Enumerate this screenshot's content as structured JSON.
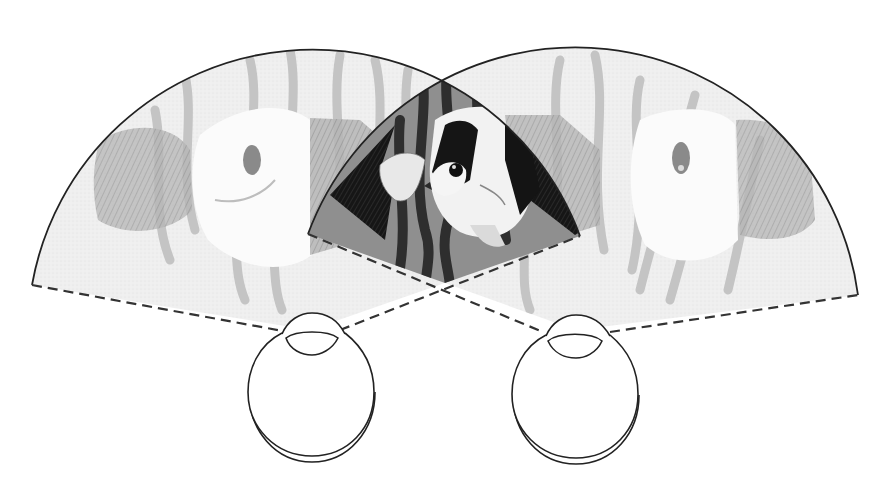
{
  "diagram": {
    "colors": {
      "background": "#ffffff",
      "outline": "#222222",
      "field_fill": "#ececec",
      "overlap_fill": "#8c8c8c",
      "weed_light": "#b8b8b8",
      "weed_dark": "#3a3a3a",
      "fish_body": "#f7f7f7",
      "fish_stripe_light": "#9a9a9a",
      "fish_stripe_dark": "#141414",
      "fish_fin": "#a8a8a8"
    },
    "eyes": [
      {
        "id": "left-eye",
        "cx": 310,
        "cy": 388,
        "r": 63
      },
      {
        "id": "right-eye",
        "cx": 576,
        "cy": 390,
        "r": 63
      }
    ],
    "fields": [
      {
        "id": "left-visual-field",
        "apex": [
          310,
          330
        ],
        "radius": 285
      },
      {
        "id": "right-visual-field",
        "apex": [
          576,
          330
        ],
        "radius": 285
      }
    ],
    "overlap": {
      "id": "binocular-overlap",
      "top": [
        451,
        82
      ],
      "bottom": [
        445,
        283
      ]
    }
  }
}
